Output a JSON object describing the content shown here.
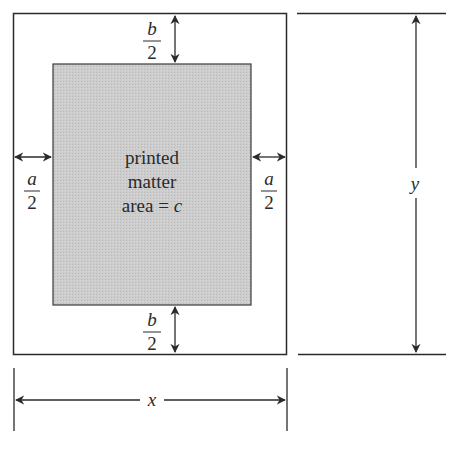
{
  "diagram": {
    "type": "poster-margin-dimension-diagram",
    "colors": {
      "line": "#2a2a2a",
      "printed_area_fill": "#c9c9c9",
      "background": "#ffffff"
    },
    "printed_area": {
      "line1": "printed",
      "line2": "matter",
      "line3": "area = c"
    },
    "margins": {
      "top": {
        "numerator": "b",
        "denominator": "2"
      },
      "bottom": {
        "numerator": "b",
        "denominator": "2"
      },
      "left": {
        "numerator": "a",
        "denominator": "2"
      },
      "right": {
        "numerator": "a",
        "denominator": "2"
      }
    },
    "dimensions": {
      "width_label": "x",
      "height_label": "y"
    }
  }
}
